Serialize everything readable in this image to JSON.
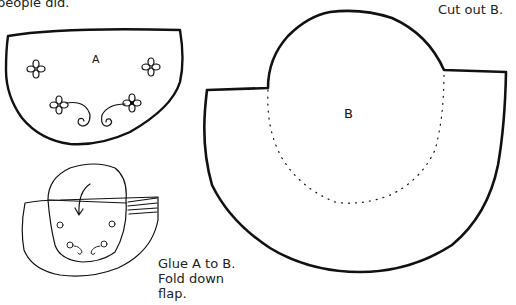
{
  "text": {
    "intro_fragment": "people did.",
    "cut_instruction": "Cut out B.",
    "glue_lines": [
      "Glue A to B.",
      "Fold down",
      "flap."
    ]
  },
  "pieces": {
    "a": {
      "label": "A",
      "decorations": "four flowers with two spiral curls"
    },
    "b": {
      "label": "B",
      "guide": "dotted fold/glue line"
    }
  },
  "colors": {
    "line": "#111111",
    "text": "#222222",
    "background": "#ffffff"
  }
}
